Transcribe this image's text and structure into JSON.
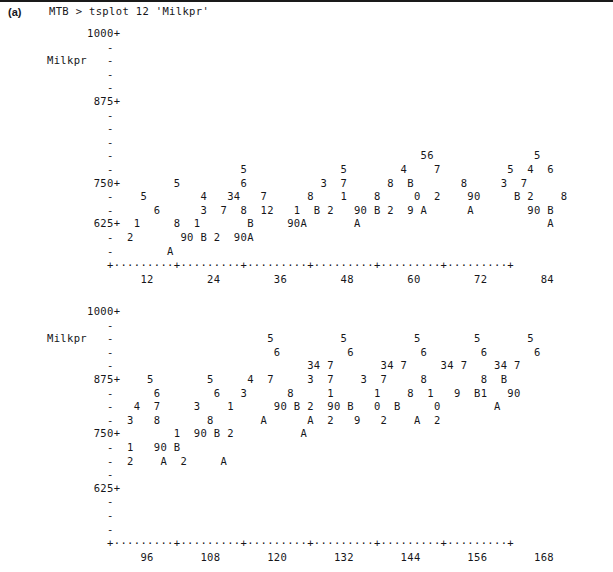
{
  "figure": {
    "panel_label": "(a)",
    "rule_color": "#1a1a1a",
    "text_color": "#16161a",
    "background": "#ffffff"
  },
  "command_line": {
    "text": "MTB > tsplot 12 'Milkpr'",
    "prompt": "MTB >",
    "command": "tsplot",
    "period": "12",
    "variable": "'Milkpr'"
  },
  "chart_data": {
    "type": "line",
    "title": "MTB > tsplot 12 'Milkpr'",
    "xlabel": "",
    "ylabel": "Milkpr",
    "grid": false,
    "legend": null,
    "panels": [
      {
        "name": "panel-1",
        "ylim": [
          625,
          1000
        ],
        "ytick_labels": [
          "1000+",
          "875+",
          "750+",
          "625+"
        ],
        "ylabel": "Milkpr",
        "xlim": [
          1,
          84
        ],
        "xtick_labels": [
          "12",
          "24",
          "36",
          "48",
          "60",
          "72",
          "84"
        ],
        "rows": [
          "      1000+",
          "         -",
          "Milkpr   -",
          "         -",
          "         -",
          "       875+",
          "         -",
          "         -",
          "         -",
          "         -                                              56               5",
          "         -                   5              5        4    7          5  4  6",
          "       750+        5         6           3  7      8  B       8     3  7",
          "         -    5        4   34   7      8    1    8     0  2    90     B 2    8",
          "         -      6      3  7  8  12   1  B 2   90 B 2  9 A      A        90 B",
          "       625+  1     8  1       B     90A       A                            A",
          "         -  2       90 B 2  90A",
          "         -        A"
        ],
        "axis_row": "         +---------+---------+---------+---------+---------+---------+",
        "tick_label_row": "              12        24        36        48        60        72        84"
      },
      {
        "name": "panel-2",
        "ylim": [
          625,
          1000
        ],
        "ytick_labels": [
          "1000+",
          "875+",
          "750+",
          "625+"
        ],
        "ylabel": "Milkpr",
        "xlim": [
          85,
          168
        ],
        "xtick_labels": [
          "96",
          "108",
          "120",
          "132",
          "144",
          "156",
          "168"
        ],
        "rows": [
          "      1000+",
          "         -",
          "Milkpr   -                       5          5          5        5       5",
          "         -                        6          6          6        6       6",
          "         -                             34 7       34 7     34 7    34 7",
          "       875+    5        5     4  7     3  7    3  7     8        8  B",
          "         -      6        6   3      8     1      1    8  1   9  B1   90",
          "         -   4  7     3    1      90 B 2  90 B   0  B     0        A",
          "         -  3   8       8       A      A  2   9   2    A  2",
          "       750+        1  90 B 2          A",
          "         -  1   90 B",
          "         -  2    A  2     A",
          "         -",
          "       625+",
          "         -",
          "         -",
          "         -"
        ],
        "axis_row": "         +---------+---------+---------+---------+---------+---------+",
        "tick_label_row": "              96       108       120       132       144       156       168"
      }
    ],
    "symbol_legend": {
      "1": "January",
      "2": "February",
      "3": "March",
      "4": "April",
      "5": "May",
      "6": "June",
      "7": "July",
      "8": "August",
      "9": "September",
      "0": "October",
      "A": "November",
      "B": "December"
    }
  }
}
